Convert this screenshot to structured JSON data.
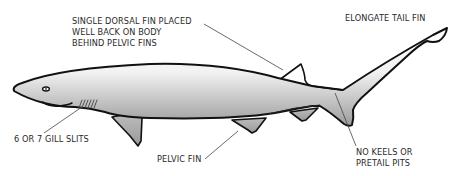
{
  "diagram": {
    "labels": {
      "dorsal_fin": [
        "SINGLE  DORSAL FIN PLACED",
        "WELL BACK ON BODY",
        "BEHIND PELVIC FINS"
      ],
      "tail_fin": [
        "ELONGATE TAIL FIN"
      ],
      "gill_slits": [
        "6 OR 7 GILL SLITS"
      ],
      "pelvic_fin": [
        "PELVIC FIN"
      ],
      "keels": [
        "NO KEELS OR",
        "PRETAIL PITS"
      ]
    },
    "colors": {
      "outline": "#111111",
      "fill_light": "#ffffff",
      "fill_dark": "#9a9a9a",
      "leader_line": "#444444",
      "text": "#2a2a2a"
    }
  }
}
